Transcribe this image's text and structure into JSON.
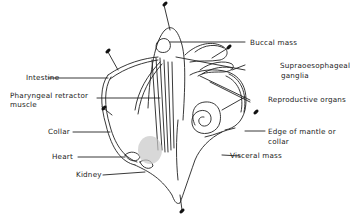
{
  "figure": {
    "labels": {
      "buccal_mass": "Buccal mass",
      "intestine": "Intestine",
      "supraoesophageal_line1": "Supraoesophageal",
      "supraoesophageal_line2": "ganglia",
      "pharyngeal_line1": "Pharyngeal retractor",
      "pharyngeal_line2": "muscle",
      "reproductive_organs": "Reproductive organs",
      "collar": "Collar",
      "edge_line1": "Edge of mantle or",
      "edge_line2": "collar",
      "heart": "Heart",
      "visceral_mass": "Visceral mass",
      "kidney": "Kidney"
    },
    "colors": {
      "line": "#222222",
      "shading": "#c8c8c8",
      "background": "#ffffff"
    }
  }
}
